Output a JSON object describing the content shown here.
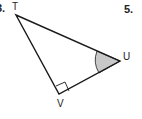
{
  "problems": [
    {
      "number": "3.",
      "visible": "partial"
    },
    {
      "number": "5."
    }
  ],
  "triangle": {
    "vertices": [
      {
        "name": "T",
        "x": 16,
        "y": 15
      },
      {
        "name": "U",
        "x": 120,
        "y": 61
      },
      {
        "name": "V",
        "x": 59,
        "y": 94
      }
    ],
    "right_angle_at": "V",
    "shaded_angle_at": "U"
  },
  "labels": {
    "T": "T",
    "U": "U",
    "V": "V",
    "problem_3": "3.",
    "problem_5": "5."
  },
  "colors": {
    "line": "#1a1a1a",
    "shade": "#c8c8c8",
    "background": "#ffffff"
  }
}
